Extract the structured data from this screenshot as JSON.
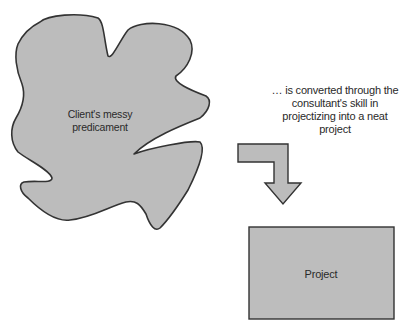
{
  "diagram": {
    "source_shape": {
      "label": "Client's messy predicament",
      "fill": "#bcbcbc",
      "stroke": "#333333"
    },
    "caption": {
      "text": "… is converted through the consultant's skill in projectizing into a neat project"
    },
    "arrow": {
      "direction": "right-then-down",
      "fill": "#bcbcbc",
      "stroke": "#333333"
    },
    "target_shape": {
      "label": "Project",
      "fill": "#bdbdbd",
      "stroke": "#333333"
    }
  }
}
